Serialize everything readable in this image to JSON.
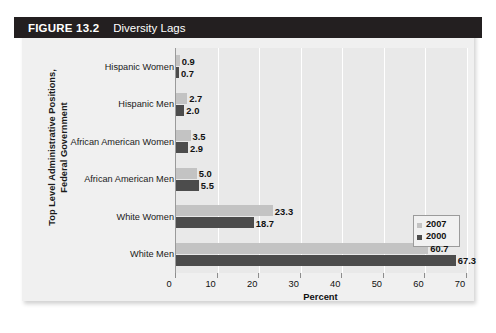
{
  "figure": {
    "number_label": "FIGURE 13.2",
    "title": "Diversity Lags"
  },
  "chart_data": {
    "type": "bar",
    "orientation": "horizontal",
    "title": "Diversity Lags",
    "xlabel": "Percent",
    "ylabel": "Top Level Administrative Positions, Federal Government",
    "ylabel_line1": "Top Level Administrative Positions,",
    "ylabel_line2": "Federal Government",
    "categories": [
      "White Men",
      "White Women",
      "African American Men",
      "African American Women",
      "Hispanic Men",
      "Hispanic Women"
    ],
    "series": [
      {
        "name": "2007",
        "color": "#c3c3c3",
        "values": [
          60.7,
          23.3,
          5.0,
          3.5,
          2.7,
          0.9
        ]
      },
      {
        "name": "2000",
        "color": "#4c4c4c",
        "values": [
          67.3,
          18.7,
          5.5,
          2.9,
          2.0,
          0.7
        ]
      }
    ],
    "xlim": [
      0,
      70
    ],
    "xticks": [
      0,
      10,
      20,
      30,
      40,
      50,
      60,
      70
    ],
    "xtick_labels": [
      "0",
      "10",
      "20",
      "30",
      "40",
      "50",
      "60",
      "70"
    ],
    "grid": "vertical",
    "legend_position": "right-middle",
    "legend_entries": [
      "2007",
      "2000"
    ],
    "value_labels": {
      "White Men": {
        "2007": "60.7",
        "2000": "67.3"
      },
      "White Women": {
        "2007": "23.3",
        "2000": "18.7"
      },
      "African American Men": {
        "2007": "5.0",
        "2000": "5.5"
      },
      "African American Women": {
        "2007": "3.5",
        "2000": "2.9"
      },
      "Hispanic Men": {
        "2007": "2.7",
        "2000": "2.0"
      },
      "Hispanic Women": {
        "2007": "0.9",
        "2000": "0.7"
      }
    }
  },
  "colors": {
    "header_bar": "#231f20",
    "card_background": "#f0f0f0",
    "plot_background": "#e9e9e9",
    "series_2007": "#c3c3c3",
    "series_2000": "#4c4c4c",
    "gridline": "#ffffff",
    "axis_line": "#9a9a9a"
  }
}
